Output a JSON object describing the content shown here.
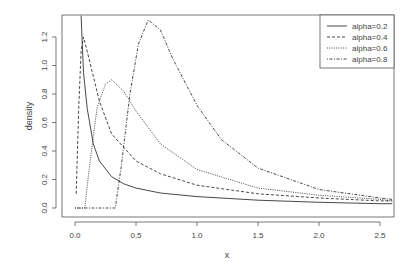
{
  "chart_data": {
    "type": "line",
    "title": "",
    "xlabel": "x",
    "ylabel": "density",
    "xlim": [
      -0.05,
      2.6
    ],
    "ylim": [
      0,
      1.35
    ],
    "xticks": [
      "0.0",
      "0.5",
      "1.0",
      "1.5",
      "2.0",
      "2.5"
    ],
    "yticks": [
      "0.0",
      "0.2",
      "0.4",
      "0.6",
      "0.8",
      "1.0",
      "1.2"
    ],
    "grid": false,
    "legend_position": "top-right",
    "series": [
      {
        "name": "alpha=0.2",
        "dash": "solid",
        "x": [
          0.05,
          0.07,
          0.1,
          0.15,
          0.2,
          0.3,
          0.4,
          0.5,
          0.7,
          1.0,
          1.5,
          2.0,
          2.5,
          2.6
        ],
        "values": [
          1.35,
          0.95,
          0.7,
          0.45,
          0.33,
          0.22,
          0.17,
          0.14,
          0.105,
          0.08,
          0.055,
          0.04,
          0.03,
          0.03
        ]
      },
      {
        "name": "alpha=0.4",
        "dash": "dashed",
        "x": [
          0.01,
          0.03,
          0.05,
          0.07,
          0.1,
          0.2,
          0.3,
          0.5,
          0.7,
          1.0,
          1.5,
          2.0,
          2.5,
          2.6
        ],
        "values": [
          0.1,
          0.7,
          1.1,
          1.2,
          1.1,
          0.75,
          0.52,
          0.33,
          0.24,
          0.16,
          0.1,
          0.07,
          0.05,
          0.05
        ]
      },
      {
        "name": "alpha=0.6",
        "dash": "dotted",
        "x": [
          0.0,
          0.08,
          0.12,
          0.18,
          0.25,
          0.3,
          0.4,
          0.5,
          0.7,
          1.0,
          1.5,
          2.0,
          2.5,
          2.6
        ],
        "values": [
          0.0,
          0.0,
          0.3,
          0.7,
          0.87,
          0.9,
          0.82,
          0.68,
          0.45,
          0.27,
          0.14,
          0.09,
          0.06,
          0.05
        ]
      },
      {
        "name": "alpha=0.8",
        "dash": "dotdash",
        "x": [
          0.0,
          0.33,
          0.38,
          0.45,
          0.52,
          0.6,
          0.7,
          0.8,
          1.0,
          1.2,
          1.5,
          2.0,
          2.5,
          2.6
        ],
        "values": [
          0.0,
          0.0,
          0.3,
          0.8,
          1.15,
          1.32,
          1.25,
          1.05,
          0.72,
          0.48,
          0.28,
          0.13,
          0.07,
          0.06
        ]
      }
    ]
  }
}
